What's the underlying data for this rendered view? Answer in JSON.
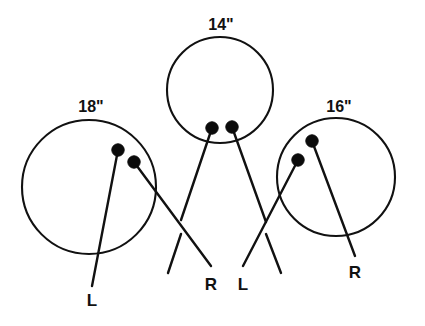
{
  "figure": {
    "stroke_color": "#111111",
    "dot_color": "#0b0b0b",
    "background_color": "#ffffff"
  },
  "balls": [
    {
      "id": "left-ball",
      "size_label": "18\"",
      "size_label_pos": {
        "x": 91,
        "y": 112
      },
      "circle": {
        "cx": 89,
        "cy": 187,
        "r": 67
      },
      "holes": [
        {
          "name": "hole-upper",
          "cx": 118,
          "cy": 150,
          "r": 6.2
        },
        {
          "name": "hole-lower",
          "cx": 134,
          "cy": 162,
          "r": 6.2
        }
      ],
      "span_lines": [
        {
          "name": "span-line-thumb",
          "x1": 118,
          "y1": 150,
          "x2": 92,
          "y2": 286
        },
        {
          "name": "span-line-finger",
          "x1": 134,
          "y1": 162,
          "x2": 211,
          "y2": 266
        }
      ],
      "hand_label": "L",
      "hand_label_pos": {
        "x": 92,
        "y": 306
      }
    },
    {
      "id": "center-ball",
      "size_label": "14\"",
      "size_label_pos": {
        "x": 221,
        "y": 30
      },
      "circle": {
        "cx": 220,
        "cy": 90,
        "r": 53
      },
      "holes": [
        {
          "name": "hole-left",
          "cx": 212,
          "cy": 128,
          "r": 6.2
        },
        {
          "name": "hole-right",
          "cx": 232,
          "cy": 127,
          "r": 6.2
        }
      ],
      "span_lines": [
        {
          "name": "span-line-left",
          "x1": 212,
          "y1": 128,
          "x2": 181,
          "y2": 220
        },
        {
          "name": "span-line-right",
          "x1": 232,
          "y1": 127,
          "x2": 266,
          "y2": 222
        }
      ],
      "hand_label": null,
      "hand_label_pos": null
    },
    {
      "id": "right-ball",
      "size_label": "16\"",
      "size_label_pos": {
        "x": 339,
        "y": 112
      },
      "circle": {
        "cx": 336,
        "cy": 177,
        "r": 59
      },
      "holes": [
        {
          "name": "hole-upper",
          "cx": 312,
          "cy": 141,
          "r": 6.2
        },
        {
          "name": "hole-lower",
          "cx": 298,
          "cy": 160,
          "r": 6.2
        }
      ],
      "span_lines": [
        {
          "name": "span-line-thumb",
          "x1": 312,
          "y1": 141,
          "x2": 355,
          "y2": 256
        },
        {
          "name": "span-line-finger",
          "x1": 298,
          "y1": 160,
          "x2": 243,
          "y2": 266
        }
      ],
      "hand_label": "R",
      "hand_label_pos": {
        "x": 355,
        "y": 278
      }
    }
  ],
  "hand_labels": [
    {
      "name": "hand-label-left-l",
      "text": "L",
      "x": 92,
      "y": 306
    },
    {
      "name": "hand-label-center-r",
      "text": "R",
      "x": 211,
      "y": 290
    },
    {
      "name": "hand-label-center-l",
      "text": "L",
      "x": 243,
      "y": 290
    },
    {
      "name": "hand-label-right-r",
      "text": "R",
      "x": 355,
      "y": 278
    }
  ],
  "tick_marks": [
    {
      "name": "tick-left",
      "x1": 181,
      "y1": 234,
      "x2": 168,
      "y2": 273
    },
    {
      "name": "tick-right",
      "x1": 266,
      "y1": 234,
      "x2": 281,
      "y2": 273
    }
  ],
  "size_labels": [
    {
      "name": "size-label-18",
      "text": "18\"",
      "x": 91,
      "y": 112
    },
    {
      "name": "size-label-14",
      "text": "14\"",
      "x": 221,
      "y": 30
    },
    {
      "name": "size-label-16",
      "text": "16\"",
      "x": 339,
      "y": 112
    }
  ]
}
